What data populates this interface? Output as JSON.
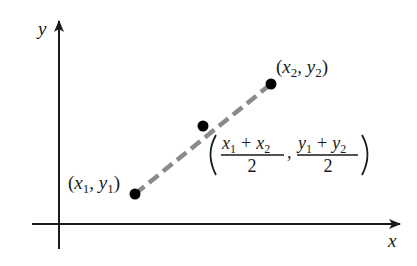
{
  "diagram": {
    "axes": {
      "x_label": "x",
      "y_label": "y"
    },
    "points": {
      "p1": {
        "label_open": "(",
        "x_var": "x",
        "x_sub": "1",
        "comma": ", ",
        "y_var": "y",
        "y_sub": "1",
        "label_close": ")"
      },
      "p2": {
        "label_open": "(",
        "x_var": "x",
        "x_sub": "2",
        "comma": ", ",
        "y_var": "y",
        "y_sub": "2",
        "label_close": ")"
      },
      "midpoint": {
        "num1_a": "x",
        "num1_a_sub": "1",
        "num1_plus": "+",
        "num1_b": "x",
        "num1_b_sub": "2",
        "den1": "2",
        "comma": ",",
        "num2_a": "y",
        "num2_a_sub": "1",
        "num2_plus": "+",
        "num2_b": "y",
        "num2_b_sub": "2",
        "den2": "2"
      }
    },
    "colors": {
      "axis": "#1a1a1a",
      "segment": "#8a8a8a",
      "point": "#000000"
    }
  }
}
